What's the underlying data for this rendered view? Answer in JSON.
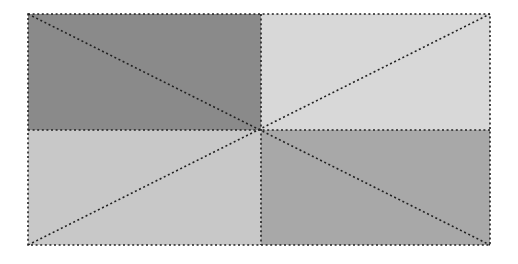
{
  "diagram": {
    "type": "quadrant-rectangle-with-diagonals",
    "background": "#ffffff",
    "rect": {
      "x": 28,
      "y": 14,
      "width": 462,
      "height": 231
    },
    "center": {
      "x": 261,
      "y": 130
    },
    "line_color": "#222222",
    "line_style": "dotted",
    "quadrants": [
      {
        "name": "top-left",
        "fill": "#8a8a8a"
      },
      {
        "name": "top-right",
        "fill": "#d8d8d8"
      },
      {
        "name": "bottom-left",
        "fill": "#c8c8c8"
      },
      {
        "name": "bottom-right",
        "fill": "#a8a8a8"
      }
    ]
  }
}
